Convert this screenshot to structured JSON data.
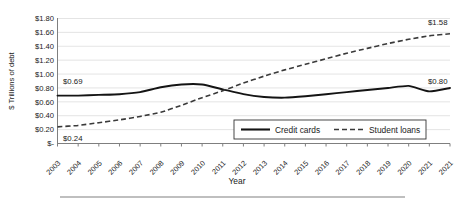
{
  "chart_data": {
    "type": "line",
    "title": "",
    "xlabel": "Year",
    "ylabel": "$ Trillions of debt",
    "ylim": [
      0,
      1.8
    ],
    "ytick_labels": [
      "$1.80",
      "$1.60",
      "$1.40",
      "$1.20",
      "$1.00",
      "$0.80",
      "$0.60",
      "$0.40",
      "$0.20",
      "$-"
    ],
    "ytick_values": [
      1.8,
      1.6,
      1.4,
      1.2,
      1.0,
      0.8,
      0.6,
      0.4,
      0.2,
      0
    ],
    "grid": true,
    "legend_position": "inside-bottom-right",
    "categories": [
      "2003",
      "2004",
      "2005",
      "2006",
      "2007",
      "2008",
      "2009",
      "2010",
      "2011",
      "2012",
      "2013",
      "2014",
      "2015",
      "2016",
      "2017",
      "2018",
      "2019",
      "2020",
      "2021",
      "2021"
    ],
    "series": [
      {
        "name": "Credit cards",
        "style": "solid",
        "color": "#141414",
        "values": [
          0.69,
          0.69,
          0.7,
          0.71,
          0.74,
          0.81,
          0.85,
          0.85,
          0.78,
          0.71,
          0.67,
          0.66,
          0.68,
          0.71,
          0.74,
          0.77,
          0.8,
          0.83,
          0.75,
          0.8
        ]
      },
      {
        "name": "Student loans",
        "style": "dashed",
        "color": "#3a3a3a",
        "values": [
          0.24,
          0.26,
          0.3,
          0.34,
          0.39,
          0.45,
          0.55,
          0.66,
          0.76,
          0.87,
          0.97,
          1.06,
          1.14,
          1.22,
          1.3,
          1.37,
          1.44,
          1.5,
          1.55,
          1.58
        ]
      }
    ],
    "annotations": [
      {
        "id": "credit-cards-start",
        "text": "$0.69",
        "value": 0.69,
        "category": "2003",
        "series": "Credit cards"
      },
      {
        "id": "student-loans-start",
        "text": "$0.24",
        "value": 0.24,
        "category": "2003",
        "series": "Student loans"
      },
      {
        "id": "student-loans-end",
        "text": "$1.58",
        "value": 1.58,
        "category": "2021",
        "series": "Student loans"
      },
      {
        "id": "credit-cards-end",
        "text": "$0.80",
        "value": 0.8,
        "category": "2021",
        "series": "Credit cards"
      }
    ],
    "legend": [
      {
        "label": "Credit cards",
        "style": "solid"
      },
      {
        "label": "Student loans",
        "style": "dashed"
      }
    ]
  }
}
